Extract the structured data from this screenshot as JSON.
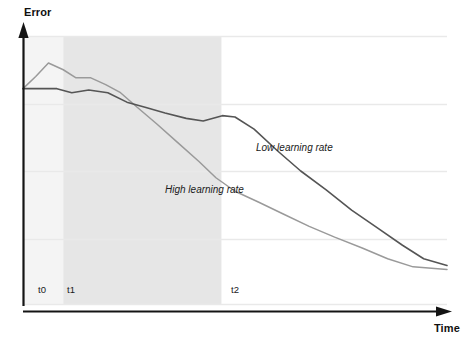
{
  "chart_data": {
    "type": "line",
    "title": "",
    "subtitle": "",
    "xlabel": "Time",
    "ylabel": "Error",
    "grid": true,
    "gridlines_y": [
      0.25,
      0.5,
      0.75,
      1.0
    ],
    "legend_position": "inline-annotations",
    "xlim": [
      0,
      1
    ],
    "ylim": [
      0,
      1
    ],
    "axis_tick_labels_x": [
      "t0",
      "t1",
      "t2"
    ],
    "axis_tick_values_x": [
      0.025,
      0.095,
      0.48
    ],
    "shaded_regions": [
      {
        "name": "pre-warmup",
        "x_start": 0.0,
        "x_end": 0.095,
        "color": "#f4f4f4"
      },
      {
        "name": "warmup-to-t2",
        "x_start": 0.095,
        "x_end": 0.468,
        "color": "#e6e6e6"
      }
    ],
    "series": [
      {
        "name": "Low learning rate",
        "color": "#555555",
        "x": [
          0.0,
          0.035,
          0.08,
          0.115,
          0.155,
          0.2,
          0.245,
          0.29,
          0.335,
          0.385,
          0.425,
          0.47,
          0.5,
          0.545,
          0.6,
          0.655,
          0.715,
          0.775,
          0.835,
          0.895,
          0.945,
          1.0
        ],
        "y": [
          0.805,
          0.805,
          0.805,
          0.79,
          0.8,
          0.79,
          0.755,
          0.735,
          0.715,
          0.695,
          0.685,
          0.705,
          0.7,
          0.655,
          0.575,
          0.5,
          0.43,
          0.355,
          0.29,
          0.225,
          0.175,
          0.15
        ]
      },
      {
        "name": "High learning rate",
        "color": "#9a9a9a",
        "x": [
          0.0,
          0.03,
          0.06,
          0.095,
          0.125,
          0.16,
          0.195,
          0.23,
          0.27,
          0.315,
          0.365,
          0.415,
          0.455,
          0.5,
          0.555,
          0.615,
          0.675,
          0.735,
          0.8,
          0.86,
          0.92,
          1.0
        ],
        "y": [
          0.805,
          0.85,
          0.9,
          0.875,
          0.845,
          0.845,
          0.82,
          0.79,
          0.735,
          0.675,
          0.605,
          0.535,
          0.475,
          0.425,
          0.385,
          0.34,
          0.295,
          0.255,
          0.215,
          0.175,
          0.145,
          0.135
        ]
      }
    ],
    "annotations": [
      {
        "text": "Low learning rate",
        "x": 0.55,
        "y": 0.58
      },
      {
        "text": "High learning rate",
        "x": 0.335,
        "y": 0.425
      }
    ],
    "colors": {
      "axis": "#141414",
      "gridline": "#e9e9e9",
      "shade_light": "#f4f4f4",
      "shade_dark": "#e6e6e6",
      "background": "#ffffff"
    }
  }
}
